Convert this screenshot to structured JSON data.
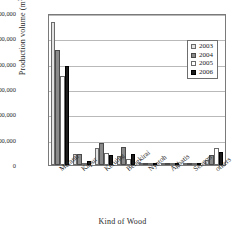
{
  "chart_data": {
    "type": "bar",
    "title": "",
    "xlabel": "Kind of Wood",
    "ylabel": "Production volume (m3)",
    "ylabel_unit_base": "Production volume (m",
    "ylabel_unit_sup": "3",
    "ylabel_unit_tail": ")",
    "ylim": [
      0,
      600000
    ],
    "ytick_values": [
      0,
      100000,
      200000,
      300000,
      400000,
      500000,
      600000
    ],
    "ytick_labels": [
      "0",
      "100,000",
      "200,000",
      "300,000",
      "400,000",
      "500,000",
      "600,000"
    ],
    "grid": true,
    "legend_position": "upper-right-inside",
    "categories": [
      "Meranti",
      "Kapur",
      "Keruing",
      "Bengkirai",
      "Nyatoh",
      "Aghatis",
      "Sengon",
      "others"
    ],
    "series": [
      {
        "name": "2003",
        "color": "#e2e2e2",
        "values": [
          565000,
          43000,
          67000,
          34000,
          3000,
          1000,
          500,
          21000
        ]
      },
      {
        "name": "2004",
        "color": "#8a8a8a",
        "values": [
          453000,
          44000,
          88000,
          72000,
          4000,
          1000,
          500,
          39000
        ]
      },
      {
        "name": "2005",
        "color": "#ffffff",
        "values": [
          350000,
          8000,
          47000,
          24000,
          6000,
          1000,
          500,
          67000
        ]
      },
      {
        "name": "2006",
        "color": "#1c1c1c",
        "values": [
          390000,
          17000,
          39000,
          45000,
          3000,
          1000,
          500,
          51000
        ]
      }
    ]
  }
}
